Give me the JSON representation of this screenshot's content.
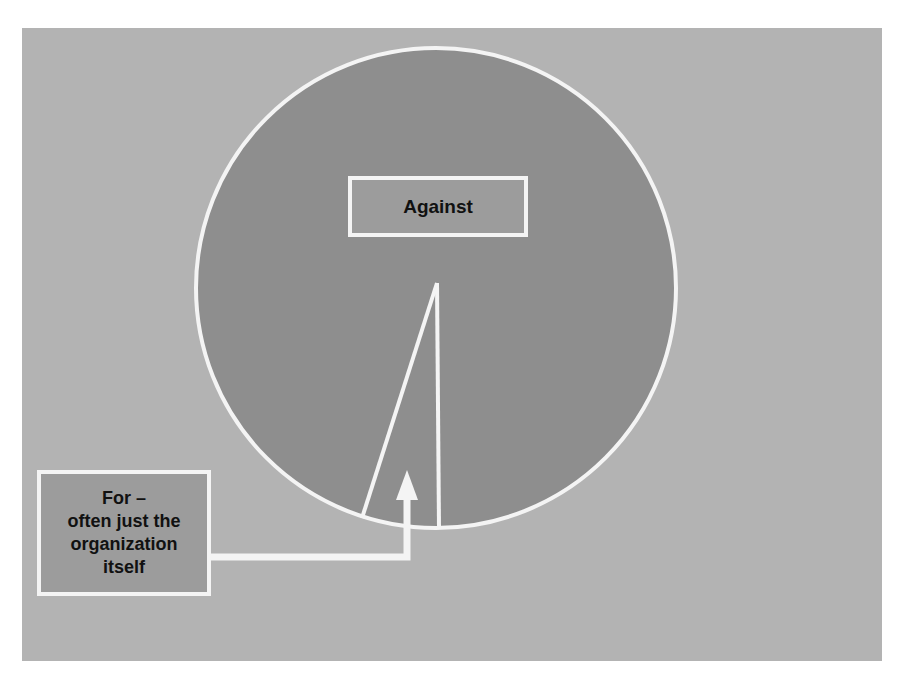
{
  "diagram": {
    "type": "pie-illustration",
    "colors": {
      "page_background": "#ffffff",
      "panel_background": "#b3b3b3",
      "pie_fill": "#8e8e8e",
      "outline": "#f4f4f4",
      "label_box_fill": "#9c9c9c",
      "text": "#111111"
    },
    "slices": [
      {
        "name": "Against",
        "share": "majority"
      },
      {
        "name": "For",
        "share": "small sliver"
      }
    ],
    "labels": {
      "against": "Against",
      "for_lines": [
        "For –",
        "often just the",
        "organization",
        "itself"
      ]
    }
  }
}
